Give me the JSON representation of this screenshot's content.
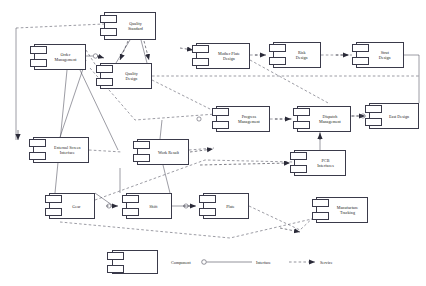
{
  "diagram": {
    "type": "uml-component-diagram",
    "title": "",
    "components": [
      {
        "id": "quality-standard",
        "label": "Quality\nStandard",
        "x": 104,
        "y": 12,
        "w": 52,
        "h": 28
      },
      {
        "id": "order-management",
        "label": "Order\nManagement",
        "x": 34,
        "y": 44,
        "w": 52,
        "h": 26
      },
      {
        "id": "quality-design",
        "label": "Quality\nDesign",
        "x": 100,
        "y": 63,
        "w": 52,
        "h": 26
      },
      {
        "id": "mother-plate-design",
        "label": "Mother Plate\nDesign",
        "x": 196,
        "y": 43,
        "w": 54,
        "h": 26
      },
      {
        "id": "risk-design",
        "label": "Risk\nDesign",
        "x": 273,
        "y": 42,
        "w": 48,
        "h": 26
      },
      {
        "id": "strut-design",
        "label": "Strut\nDesign",
        "x": 356,
        "y": 42,
        "w": 48,
        "h": 26
      },
      {
        "id": "progress-management",
        "label": "Progress\nManagement",
        "x": 216,
        "y": 106,
        "w": 54,
        "h": 26
      },
      {
        "id": "dispatch-management",
        "label": "Dispatch\nManagement",
        "x": 297,
        "y": 106,
        "w": 54,
        "h": 26
      },
      {
        "id": "east-design",
        "label": "East Design",
        "x": 369,
        "y": 103,
        "w": 50,
        "h": 26
      },
      {
        "id": "external-screen",
        "label": "External Screen\nInterface",
        "x": 33,
        "y": 137,
        "w": 56,
        "h": 26
      },
      {
        "id": "work-result",
        "label": "Work Result",
        "x": 137,
        "y": 139,
        "w": 52,
        "h": 26
      },
      {
        "id": "pcb-interfaces",
        "label": "PCB\nInterfaces",
        "x": 294,
        "y": 150,
        "w": 52,
        "h": 26
      },
      {
        "id": "gear",
        "label": "Gear",
        "x": 49,
        "y": 193,
        "w": 46,
        "h": 26
      },
      {
        "id": "shift",
        "label": "Shift",
        "x": 126,
        "y": 193,
        "w": 46,
        "h": 26
      },
      {
        "id": "plate",
        "label": "Plate",
        "x": 203,
        "y": 193,
        "w": 46,
        "h": 26
      },
      {
        "id": "manufacture-tracking",
        "label": "Manufacture\nTracking",
        "x": 316,
        "y": 197,
        "w": 52,
        "h": 26
      }
    ],
    "legend": {
      "component_label": "Component",
      "interface_label": "Interface",
      "service_label": "Service"
    },
    "colors": {
      "stroke": "#3a3a4a",
      "background": "#ffffff",
      "text": "#1a1a1a"
    }
  }
}
